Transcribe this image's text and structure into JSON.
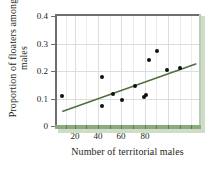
{
  "chart_data": {
    "type": "scatter",
    "title": "",
    "xlabel": "Number of territorial males",
    "ylabel": "Proportion of floaters among males",
    "xlim": [
      10,
      90
    ],
    "ylim": [
      0,
      0.4
    ],
    "xticks": [
      20,
      40,
      60,
      80
    ],
    "xticklabels": [
      "20",
      "40",
      "60",
      "80"
    ],
    "yticks": [
      0,
      0.1,
      0.2,
      0.3,
      0.4
    ],
    "yticklabels": [
      "0",
      "0.1",
      "0.2",
      "0.3",
      "0.4"
    ],
    "grid": true,
    "legend": "none",
    "series": [
      {
        "name": "observations",
        "marker": "circle",
        "color": "#111111",
        "points": [
          {
            "x": 14,
            "y": 0.108
          },
          {
            "x": 36,
            "y": 0.178
          },
          {
            "x": 36,
            "y": 0.074
          },
          {
            "x": 42,
            "y": 0.115
          },
          {
            "x": 47,
            "y": 0.094
          },
          {
            "x": 54,
            "y": 0.147
          },
          {
            "x": 59,
            "y": 0.104
          },
          {
            "x": 60,
            "y": 0.114
          },
          {
            "x": 62,
            "y": 0.239
          },
          {
            "x": 66,
            "y": 0.271
          },
          {
            "x": 72,
            "y": 0.204
          },
          {
            "x": 79,
            "y": 0.212
          }
        ]
      }
    ],
    "trendline": {
      "name": "least-squares regression line",
      "color": "#4f7040",
      "x_start": 14,
      "y_start": 0.053,
      "x_end": 88,
      "y_end": 0.226
    }
  },
  "style": {
    "frame_color": "#6e6e6e",
    "accent_green": "#8aab7d",
    "shadow_green": "#cfdcc8",
    "grid_color": "#dddddd",
    "text_color": "#231f20",
    "background": "#ffffff"
  }
}
